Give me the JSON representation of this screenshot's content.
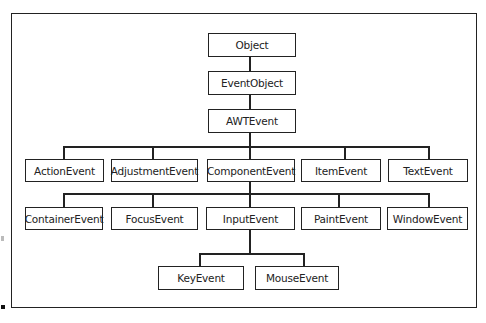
{
  "diagram": {
    "type": "class-hierarchy",
    "root": "Object",
    "levels": [
      {
        "nodes": [
          {
            "id": "object",
            "label": "Object",
            "x": 208,
            "y": 33,
            "w": 88,
            "h": 24
          }
        ]
      },
      {
        "nodes": [
          {
            "id": "eventobject",
            "label": "EventObject",
            "x": 208,
            "y": 71,
            "w": 88,
            "h": 24
          }
        ]
      },
      {
        "nodes": [
          {
            "id": "awtevent",
            "label": "AWTEvent",
            "x": 208,
            "y": 109,
            "w": 88,
            "h": 24
          }
        ]
      },
      {
        "nodes": [
          {
            "id": "actionevent",
            "label": "ActionEvent",
            "x": 25,
            "y": 159,
            "w": 79,
            "h": 23
          },
          {
            "id": "adjustmentevent",
            "label": "AdjustmentEvent",
            "x": 111,
            "y": 159,
            "w": 87,
            "h": 23
          },
          {
            "id": "componentevent",
            "label": "ComponentEvent",
            "x": 207,
            "y": 159,
            "w": 88,
            "h": 23
          },
          {
            "id": "itemevent",
            "label": "ItemEvent",
            "x": 301,
            "y": 159,
            "w": 80,
            "h": 23
          },
          {
            "id": "textevent",
            "label": "TextEvent",
            "x": 388,
            "y": 159,
            "w": 80,
            "h": 23
          }
        ]
      },
      {
        "nodes": [
          {
            "id": "containerevent",
            "label": "ContainerEvent",
            "x": 25,
            "y": 207,
            "w": 78,
            "h": 23
          },
          {
            "id": "focusevent",
            "label": "FocusEvent",
            "x": 111,
            "y": 207,
            "w": 87,
            "h": 23
          },
          {
            "id": "inputevent",
            "label": "InputEvent",
            "x": 206,
            "y": 207,
            "w": 89,
            "h": 23
          },
          {
            "id": "paintevent",
            "label": "PaintEvent",
            "x": 301,
            "y": 207,
            "w": 80,
            "h": 23
          },
          {
            "id": "windowevent",
            "label": "WindowEvent",
            "x": 387,
            "y": 207,
            "w": 81,
            "h": 23
          }
        ]
      },
      {
        "nodes": [
          {
            "id": "keyevent",
            "label": "KeyEvent",
            "x": 158,
            "y": 266,
            "w": 86,
            "h": 24
          },
          {
            "id": "mouseevent",
            "label": "MouseEvent",
            "x": 255,
            "y": 266,
            "w": 84,
            "h": 24
          }
        ]
      }
    ],
    "edges": [
      [
        "Object",
        "EventObject"
      ],
      [
        "EventObject",
        "AWTEvent"
      ],
      [
        "AWTEvent",
        "ActionEvent"
      ],
      [
        "AWTEvent",
        "AdjustmentEvent"
      ],
      [
        "AWTEvent",
        "ComponentEvent"
      ],
      [
        "AWTEvent",
        "ItemEvent"
      ],
      [
        "AWTEvent",
        "TextEvent"
      ],
      [
        "ComponentEvent",
        "ContainerEvent"
      ],
      [
        "ComponentEvent",
        "FocusEvent"
      ],
      [
        "ComponentEvent",
        "InputEvent"
      ],
      [
        "ComponentEvent",
        "PaintEvent"
      ],
      [
        "ComponentEvent",
        "WindowEvent"
      ],
      [
        "InputEvent",
        "KeyEvent"
      ],
      [
        "InputEvent",
        "MouseEvent"
      ]
    ],
    "colors": {
      "line": "#222222",
      "background": "#ffffff",
      "text": "#222222"
    }
  }
}
